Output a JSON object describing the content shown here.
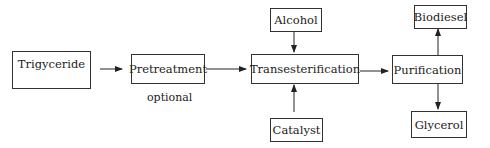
{
  "diagram": {
    "title": "",
    "nodes": {
      "trigyceride": "Trigyceride",
      "pretreatment": "Pretreatment",
      "alcohol": "Alcohol",
      "transesterification": "Transesterification",
      "catalyst": "Catalyst",
      "purification": "Purification",
      "biodiesel": "Biodiesel",
      "glycerol": "Glycerol"
    },
    "annotations": {
      "optional": "optional"
    },
    "edges": [
      {
        "from": "Trigyceride",
        "to": "Pretreatment"
      },
      {
        "from": "Pretreatment",
        "to": "Transesterification"
      },
      {
        "from": "Alcohol",
        "to": "Transesterification"
      },
      {
        "from": "Catalyst",
        "to": "Transesterification"
      },
      {
        "from": "Transesterification",
        "to": "Purification"
      },
      {
        "from": "Purification",
        "to": "Biodiesel"
      },
      {
        "from": "Purification",
        "to": "Glycerol"
      }
    ],
    "colors": {
      "stroke": "#333333",
      "text": "#222222",
      "background": "#ffffff"
    }
  }
}
